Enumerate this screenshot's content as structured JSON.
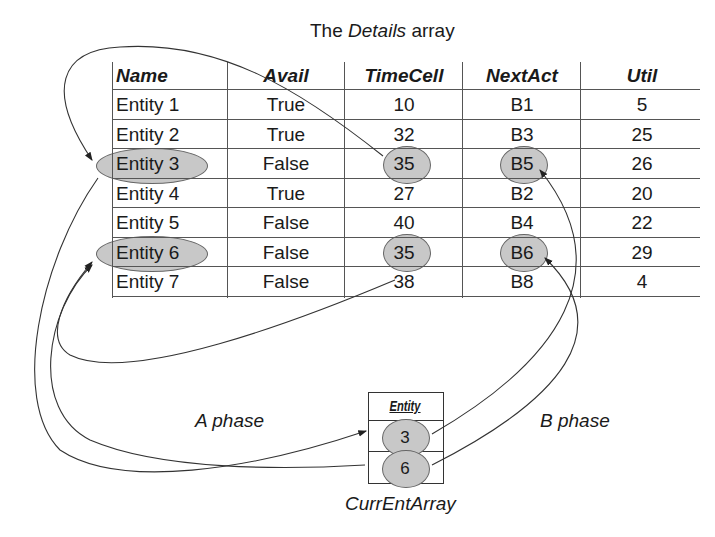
{
  "title": {
    "prefix": "The ",
    "italic": "Details",
    "suffix": " array"
  },
  "details_table": {
    "headers": [
      "Name",
      "Avail",
      "TimeCell",
      "NextAct",
      "Util"
    ],
    "rows": [
      [
        "Entity 1",
        "True",
        "10",
        "B1",
        "5"
      ],
      [
        "Entity 2",
        "True",
        "32",
        "B3",
        "25"
      ],
      [
        "Entity 3",
        "False",
        "35",
        "B5",
        "26"
      ],
      [
        "Entity 4",
        "True",
        "27",
        "B2",
        "20"
      ],
      [
        "Entity 5",
        "False",
        "40",
        "B4",
        "22"
      ],
      [
        "Entity 6",
        "False",
        "35",
        "B6",
        "29"
      ],
      [
        "Entity 7",
        "False",
        "38",
        "B8",
        "4"
      ]
    ],
    "highlighted_rows": [
      "Entity 3",
      "Entity 6"
    ]
  },
  "curr_ent_array": {
    "header": "Entity",
    "values": [
      "3",
      "6"
    ],
    "caption": "CurrEntArray"
  },
  "phase_labels": {
    "a": "A phase",
    "b": "B phase"
  },
  "colors": {
    "highlight": "#c8c8c8",
    "line": "#333333"
  }
}
